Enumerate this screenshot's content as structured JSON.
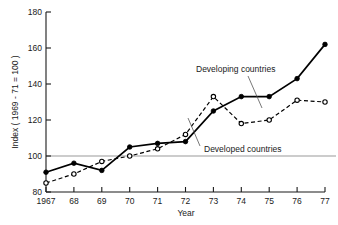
{
  "chart_data": {
    "type": "line",
    "title": "",
    "xlabel": "Year",
    "ylabel": "Index ( 1969 - 71 = 100 )",
    "x": [
      1967,
      1968,
      1969,
      1970,
      1971,
      1972,
      1973,
      1974,
      1975,
      1976,
      1977
    ],
    "xtick_labels": [
      "1967",
      "68",
      "69",
      "70",
      "71",
      "72",
      "73",
      "74",
      "75",
      "76",
      "77"
    ],
    "ytick_labels": [
      "180",
      "160",
      "140",
      "120",
      "100",
      "80"
    ],
    "yticks": [
      180,
      160,
      140,
      120,
      100,
      80
    ],
    "ylim": [
      80,
      180
    ],
    "xlim": [
      1967,
      1977
    ],
    "grid": false,
    "reference_line": 100,
    "legend_position": "inline-annotation",
    "series": [
      {
        "name": "Developing countries",
        "marker": "filled-circle",
        "line_style": "solid",
        "color": "#000000",
        "values": [
          91,
          96,
          92,
          105,
          107,
          108,
          125,
          133,
          133,
          143,
          162
        ]
      },
      {
        "name": "Developed countries",
        "marker": "open-circle",
        "line_style": "dashed",
        "color": "#000000",
        "values": [
          85,
          90,
          97,
          100,
          104,
          112,
          133,
          118,
          120,
          131,
          130
        ]
      }
    ],
    "annotations": [
      {
        "text": "Developing countries",
        "target_x": 1974,
        "target_y": 133
      },
      {
        "text": "Developed countries",
        "target_x": 1973,
        "target_y": 133
      }
    ]
  },
  "axis": {
    "y_title": "Index ( 1969 - 71 = 100 )",
    "x_title": "Year"
  }
}
